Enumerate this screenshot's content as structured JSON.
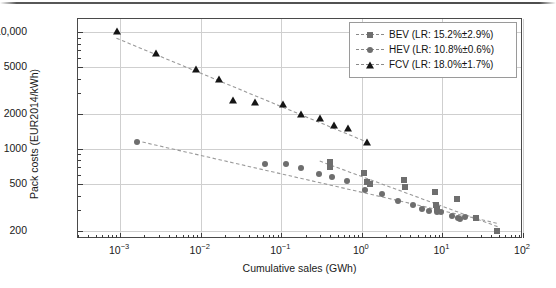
{
  "chart_data": {
    "type": "scatter",
    "title": "",
    "xlabel": "Cumulative sales (GWh)",
    "ylabel": "Pack costs (EUR2014/kWh)",
    "xscale": "log",
    "yscale": "log",
    "xlim": [
      0.0003,
      100
    ],
    "ylim": [
      170,
      13000
    ],
    "grid": true,
    "legend_position": "top-right",
    "xticks": [
      {
        "value": 0.001,
        "label": "10",
        "exp": "−3"
      },
      {
        "value": 0.01,
        "label": "10",
        "exp": "−2"
      },
      {
        "value": 0.1,
        "label": "10",
        "exp": "−1"
      },
      {
        "value": 1,
        "label": "10",
        "exp": "0"
      },
      {
        "value": 10,
        "label": "10",
        "exp": "1"
      },
      {
        "value": 100,
        "label": "10",
        "exp": "2"
      }
    ],
    "yticks": [
      {
        "value": 200,
        "label": "200"
      },
      {
        "value": 500,
        "label": "500"
      },
      {
        "value": 1000,
        "label": "1000"
      },
      {
        "value": 2000,
        "label": "2000"
      },
      {
        "value": 5000,
        "label": "5000"
      },
      {
        "value": 10000,
        "label": "10,000"
      }
    ],
    "series": [
      {
        "name": "BEV",
        "legend_label": "BEV (LR: 15.2%±2.9%)",
        "learning_rate": "15.2%±2.9%",
        "marker": "square",
        "color": "#6e6e6e",
        "trendline": {
          "style": "dashed",
          "x": [
            0.3,
            50
          ],
          "y": [
            790,
            215
          ]
        },
        "points": [
          [
            0.4,
            780
          ],
          [
            0.4,
            735
          ],
          [
            0.4,
            700
          ],
          [
            1.05,
            620
          ],
          [
            1.15,
            520
          ],
          [
            1.25,
            505
          ],
          [
            3.3,
            545
          ],
          [
            3.4,
            470
          ],
          [
            8.2,
            430
          ],
          [
            8.4,
            330
          ],
          [
            8.6,
            310
          ],
          [
            15.0,
            375
          ],
          [
            26.0,
            255
          ],
          [
            48.0,
            200
          ]
        ]
      },
      {
        "name": "HEV",
        "legend_label": "HEV (LR: 10.8%±0.6%)",
        "learning_rate": "10.8%±0.6%",
        "marker": "circle",
        "color": "#6e6e6e",
        "trendline": {
          "style": "dashed",
          "x": [
            0.0016,
            50
          ],
          "y": [
            1180,
            230
          ]
        },
        "points": [
          [
            0.0016,
            1150
          ],
          [
            0.062,
            750
          ],
          [
            0.115,
            740
          ],
          [
            0.175,
            690
          ],
          [
            0.295,
            610
          ],
          [
            0.43,
            575
          ],
          [
            0.66,
            535
          ],
          [
            1.1,
            450
          ],
          [
            1.8,
            410
          ],
          [
            2.8,
            360
          ],
          [
            4.3,
            330
          ],
          [
            5.6,
            310
          ],
          [
            6.8,
            295
          ],
          [
            8.5,
            290
          ],
          [
            9.6,
            288
          ],
          [
            13.0,
            265
          ],
          [
            15.5,
            255
          ],
          [
            16.5,
            253
          ],
          [
            19.0,
            262
          ]
        ]
      },
      {
        "name": "FCV",
        "legend_label": "FCV (LR: 18.0%±1.7%)",
        "learning_rate": "18.0%±1.7%",
        "marker": "triangle",
        "color": "#151515",
        "trendline": {
          "style": "dashed",
          "x": [
            0.0009,
            1.15
          ],
          "y": [
            8900,
            1150
          ]
        },
        "points": [
          [
            0.00092,
            10200
          ],
          [
            0.0028,
            6700
          ],
          [
            0.0088,
            4850
          ],
          [
            0.017,
            3950
          ],
          [
            0.025,
            2650
          ],
          [
            0.047,
            2550
          ],
          [
            0.105,
            2450
          ],
          [
            0.175,
            1980
          ],
          [
            0.3,
            1830
          ],
          [
            0.45,
            1620
          ],
          [
            0.68,
            1520
          ],
          [
            1.15,
            1150
          ]
        ]
      }
    ]
  }
}
